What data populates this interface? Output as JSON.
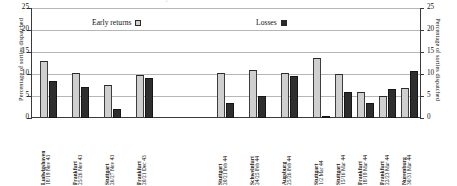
{
  "top_strip_ghost": "Early returns   Losses",
  "axis": {
    "ylabel_left": "Percentage of sorties dispatched",
    "ylabel_right": "Percentage of sorties dispatched",
    "ticks": [
      "25",
      "20",
      "15",
      "10",
      "5",
      "0"
    ],
    "ymin": 0,
    "ymax": 25
  },
  "legend": {
    "early_label": "Early returns",
    "loss_label": "Losses",
    "early_color": "#d0d0d0",
    "loss_color": "#2b2b2b"
  },
  "chart_data": {
    "type": "bar",
    "title": "",
    "xlabel": "",
    "ylabel": "Percentage of sorties dispatched",
    "ylim": [
      0,
      25
    ],
    "yticks": [
      0,
      5,
      10,
      15,
      20,
      25
    ],
    "grid": true,
    "legend_position": "top",
    "categories": [
      "Ludwigshaven 18/19 Nov 43",
      "Frankfurt 25/26 Nov 43",
      "Stuttgart 26/27 Nov 43",
      "Frankfurt 20/21 Dec 43",
      "Stuttgart 20/21 Feb 44",
      "Schweinfurt 24/25 Feb 44",
      "Augsburg 25/26 Feb 44",
      "Stuttgart 1/2 Mar 44",
      "Stuttgart 15/16 Mar 44",
      "Frankfurt 18/19 Mar 44",
      "Frankfurt 22/23 Mar 44",
      "Nuremburg 30/31 Mar 44"
    ],
    "series": [
      {
        "name": "Early returns",
        "color": "#d0d0d0",
        "values": [
          13.0,
          10.2,
          7.6,
          9.7,
          10.2,
          10.8,
          10.2,
          13.7,
          9.9,
          5.9,
          4.9,
          6.8
        ]
      },
      {
        "name": "Losses",
        "color": "#2b2b2b",
        "values": [
          8.5,
          7.1,
          2.0,
          9.2,
          3.3,
          4.9,
          9.5,
          0.3,
          6.0,
          3.3,
          6.7,
          10.6
        ]
      }
    ]
  },
  "x_labels": [
    {
      "place": "Ludwigshaven",
      "date": "18/19 Nov 43"
    },
    {
      "place": "Frankfurt",
      "date": "25/26 Nov 43"
    },
    {
      "place": "Stuttgart",
      "date": "26/27 Nov 43"
    },
    {
      "place": "Frankfurt",
      "date": "20/21 Dec 43"
    },
    {
      "place": "Stuttgart",
      "date": "20/21 Feb 44"
    },
    {
      "place": "Schweinfurt",
      "date": "24/25 Feb 44"
    },
    {
      "place": "Augsburg",
      "date": "25/26 Feb 44"
    },
    {
      "place": "Stuttgart",
      "date": "1/2 Mar 44"
    },
    {
      "place": "Stuttgart",
      "date": "15/16 Mar 44"
    },
    {
      "place": "Frankfurt",
      "date": "18/19 Mar 44"
    },
    {
      "place": "Frankfurt",
      "date": "22/23 Mar 44"
    },
    {
      "place": "Nuremburg",
      "date": "30/31 Mar 44"
    }
  ],
  "layout": {
    "group_breaks": [
      4
    ],
    "bar_x_positions": [
      8,
      40,
      72,
      104,
      185,
      217,
      249,
      281,
      303,
      325,
      347,
      369
    ]
  }
}
